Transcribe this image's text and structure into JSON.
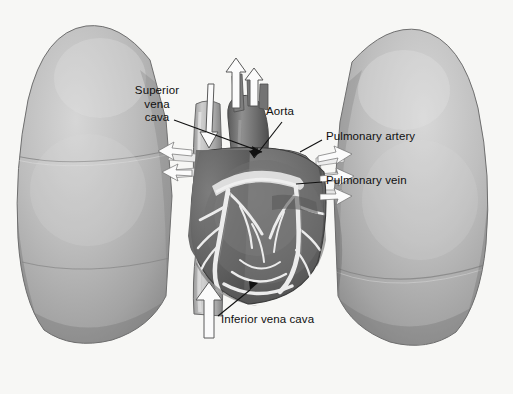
{
  "figure": {
    "type": "anatomical-illustration",
    "style": "grayscale halftone medical diagram",
    "background_color": "#f7f7f5"
  },
  "labels": {
    "superior_vena_cava": "Superior\nvena\ncava",
    "aorta": "Aorta",
    "pulmonary_artery": "Pulmonary artery",
    "pulmonary_vein": "Pulmonary vein",
    "inferior_vena_cava": "Inferior vena cava"
  },
  "structures": {
    "left_lung": "left lung",
    "right_lung": "right lung",
    "heart": "heart",
    "aortic_arch": "aortic arch",
    "pulmonary_trunk": "pulmonary trunk",
    "coronary_vessels": "coronary vessels",
    "superior_vena_cava": "superior vena cava",
    "inferior_vena_cava": "inferior vena cava"
  },
  "flow_arrows": {
    "aorta_branch_left": "upward blood flow arrow",
    "aorta_branch_right": "upward blood flow arrow",
    "svc_inflow": "downward blood flow arrow",
    "ivc_inflow": "upward blood flow arrow",
    "to_left_lung": "blood flow arrow to left lung",
    "to_right_lung": "blood flow arrow to right lung"
  },
  "colors": {
    "lung_light": "#cfcfcf",
    "lung_mid": "#a8a8a8",
    "lung_dark": "#8b8b8b",
    "heart_dark": "#5e5e5e",
    "heart_mid": "#7a7a7a",
    "vessel_light": "#c8c8c8",
    "vessel_white": "#f2f2f2",
    "outline": "#2a2a2a",
    "label_text": "#101010"
  }
}
